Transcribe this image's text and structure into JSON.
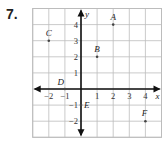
{
  "problem_number": "7.",
  "chart_data": {
    "type": "scatter",
    "title": "",
    "xlabel": "x",
    "ylabel": "y",
    "xlim": [
      -3,
      5
    ],
    "ylim": [
      -3,
      5
    ],
    "grid": true,
    "x_tick_labels": [
      "-2",
      "-1",
      "1",
      "2",
      "3",
      "4"
    ],
    "y_tick_labels": [
      "4",
      "3",
      "2",
      "1",
      "-1",
      "-2"
    ],
    "points": [
      {
        "label": "A",
        "x": 2,
        "y": 4
      },
      {
        "label": "B",
        "x": 1,
        "y": 2
      },
      {
        "label": "C",
        "x": -2,
        "y": 3
      },
      {
        "label": "D",
        "x": -1,
        "y": 0
      },
      {
        "label": "E",
        "x": 0,
        "y": -1
      },
      {
        "label": "F",
        "x": 4,
        "y": -2
      }
    ]
  }
}
